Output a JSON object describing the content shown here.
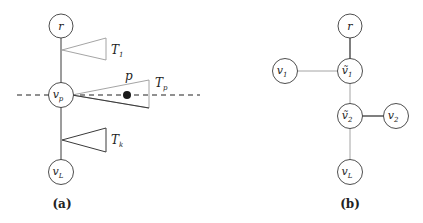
{
  "panel_a": {
    "caption": "(a)",
    "nodes": {
      "r": {
        "label": "r"
      },
      "vp": {
        "label": "v",
        "sub": "p"
      },
      "vL": {
        "label": "v",
        "sub": "L"
      }
    },
    "subtrees": {
      "T1": {
        "label": "T",
        "sub": "1"
      },
      "Tp": {
        "label": "T",
        "sub": "p"
      },
      "Tk": {
        "label": "T",
        "sub": "k"
      }
    },
    "point": {
      "label": "p"
    },
    "dashed_line": "horizontal line through v_p"
  },
  "panel_b": {
    "caption": "(b)",
    "nodes": {
      "r": {
        "label": "r"
      },
      "vt1": {
        "label": "ṽ",
        "sub": "1"
      },
      "v1": {
        "label": "v",
        "sub": "1"
      },
      "vt2": {
        "label": "ṽ",
        "sub": "2"
      },
      "v2": {
        "label": "v",
        "sub": "2"
      },
      "vL": {
        "label": "v",
        "sub": "L"
      }
    },
    "edges": [
      [
        "r",
        "vt1"
      ],
      [
        "v1",
        "vt1"
      ],
      [
        "vt1",
        "vt2"
      ],
      [
        "vt2",
        "v2"
      ],
      [
        "vt2",
        "vL"
      ]
    ]
  },
  "colors": {
    "stroke": "#3a3a3a",
    "light_stroke": "#9a9a9a",
    "dot": "#1a1a1a"
  }
}
